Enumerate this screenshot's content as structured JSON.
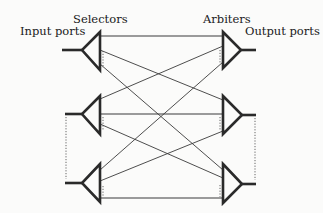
{
  "diagram": {
    "labels": {
      "input_ports": "Input ports",
      "selectors": "Selectors",
      "arbiters": "Arbiters",
      "output_ports": "Output ports"
    },
    "selectors": [
      {
        "id": "selector-1",
        "base_x": 100,
        "top_y": 32,
        "bottom_y": 70,
        "apex_x": 82,
        "apex_y": 50,
        "stem_x": 62
      },
      {
        "id": "selector-2",
        "base_x": 100,
        "top_y": 96,
        "bottom_y": 134,
        "apex_x": 82,
        "apex_y": 114,
        "stem_x": 65
      },
      {
        "id": "selector-3",
        "base_x": 100,
        "top_y": 164,
        "bottom_y": 202,
        "apex_x": 82,
        "apex_y": 183,
        "stem_x": 65
      }
    ],
    "arbiters": [
      {
        "id": "arbiter-1",
        "base_x": 223,
        "top_y": 32,
        "bottom_y": 68,
        "apex_x": 241,
        "apex_y": 50,
        "stem_x": 256
      },
      {
        "id": "arbiter-2",
        "base_x": 223,
        "top_y": 96,
        "bottom_y": 134,
        "apex_x": 242,
        "apex_y": 115,
        "stem_x": 256
      },
      {
        "id": "arbiter-3",
        "base_x": 223,
        "top_y": 164,
        "bottom_y": 203,
        "apex_x": 242,
        "apex_y": 184,
        "stem_x": 256
      }
    ],
    "connections": [
      {
        "from": "selector-1",
        "to": "arbiter-1",
        "y1": 36,
        "y2": 36
      },
      {
        "from": "selector-1",
        "to": "arbiter-2",
        "y1": 50,
        "y2": 100
      },
      {
        "from": "selector-1",
        "to": "arbiter-3",
        "y1": 64,
        "y2": 170
      },
      {
        "from": "selector-2",
        "to": "arbiter-1",
        "y1": 99,
        "y2": 46
      },
      {
        "from": "selector-2",
        "to": "arbiter-2",
        "y1": 114,
        "y2": 114
      },
      {
        "from": "selector-2",
        "to": "arbiter-3",
        "y1": 124,
        "y2": 178
      },
      {
        "from": "selector-3",
        "to": "arbiter-1",
        "y1": 170,
        "y2": 62
      },
      {
        "from": "selector-3",
        "to": "arbiter-2",
        "y1": 181,
        "y2": 131
      },
      {
        "from": "selector-3",
        "to": "arbiter-3",
        "y1": 198,
        "y2": 198
      }
    ]
  }
}
